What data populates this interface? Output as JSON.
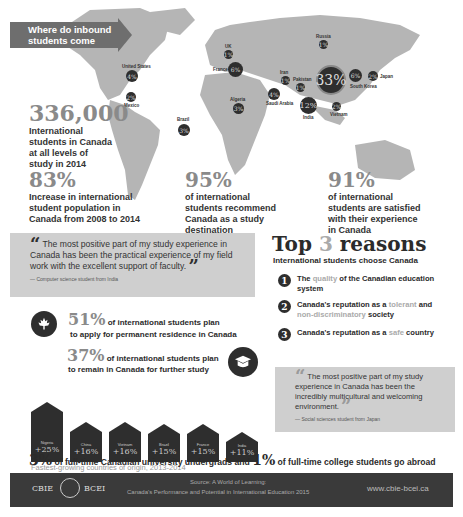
{
  "map": {
    "banner": "Where do inbound students come from?",
    "countries": [
      {
        "name": "United States",
        "value": "4%"
      },
      {
        "name": "Mexico",
        "value": "2%"
      },
      {
        "name": "Brazil",
        "value": "3%"
      },
      {
        "name": "UK",
        "value": "1%"
      },
      {
        "name": "France",
        "value": "6%"
      },
      {
        "name": "Algeria",
        "value": "3%"
      },
      {
        "name": "Iran",
        "value": "1%"
      },
      {
        "name": "Saudi Arabia",
        "value": "4%"
      },
      {
        "name": "Pakistan",
        "value": "1%"
      },
      {
        "name": "Russia",
        "value": "1%"
      },
      {
        "name": "China",
        "value": "33%"
      },
      {
        "name": "India",
        "value": "12%"
      },
      {
        "name": "South Korea",
        "value": "6%"
      },
      {
        "name": "Japan",
        "value": "2%"
      },
      {
        "name": "Vietnam",
        "value": "2%"
      }
    ]
  },
  "stats": {
    "total": {
      "number": "336,000",
      "text": "International students in Canada at all levels of study in 2014"
    },
    "growth": {
      "number": "83%",
      "text": "Increase in international student population in Canada from 2008 to 2014"
    },
    "recommend": {
      "number": "95%",
      "text": "of international students recommend Canada as a study destination"
    },
    "satisfied": {
      "number": "91%",
      "text": "of international students are satisfied with their experience in Canada"
    }
  },
  "quote1": {
    "text": "The most positive part of my study experience in Canada has been the practical experience of my field work with the excellent support of faculty.",
    "attribution": "— Computer science student from India"
  },
  "top3": {
    "title_pre": "Top",
    "title_num": "3",
    "title_post": "reasons",
    "subtitle": "International students choose Canada",
    "reasons": [
      {
        "num": "1",
        "pre": "The",
        "hl": "quality",
        "post": "of the Canadian education system"
      },
      {
        "num": "2",
        "pre": "Canada's reputation as a",
        "hl": "tolerant",
        "mid": "and",
        "hl2": "non-discriminatory",
        "post": "society"
      },
      {
        "num": "3",
        "pre": "Canada's reputation as a",
        "hl": "safe",
        "post": "country"
      }
    ]
  },
  "residence": {
    "number": "51%",
    "text1": "of international students plan",
    "text2": "to apply for permanent residence in Canada"
  },
  "further_study": {
    "number": "37%",
    "text1": "of international students plan",
    "text2": "to remain in Canada for further study"
  },
  "fastest": {
    "caption": "Fastest-growing countries of origin, 2013-2014",
    "items": [
      {
        "country": "Nigeria",
        "value": "+25%"
      },
      {
        "country": "China",
        "value": "+16%"
      },
      {
        "country": "Vietnam",
        "value": "+16%"
      },
      {
        "country": "Brazil",
        "value": "+15%"
      },
      {
        "country": "France",
        "value": "+15%"
      },
      {
        "country": "India",
        "value": "+11%"
      }
    ]
  },
  "quote2": {
    "text": "The most positive part of my study experience in Canada has been the incredibly multicultural and welcoming environment.",
    "attribution": "— Social sciences student from Japan"
  },
  "abroad": {
    "num1": "3%",
    "text1": "of full-time Canadian university undergrads and",
    "num2": "1%",
    "text2": "of full-time college students go abroad"
  },
  "footer": {
    "logo_left": "CBIE",
    "logo_right": "BCEI",
    "source1": "Source: A World of Learning:",
    "source2": "Canada's Performance and Potential in International Education 2015",
    "url": "www.cbie-bcei.ca"
  }
}
